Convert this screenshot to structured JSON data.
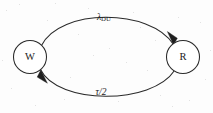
{
  "figure": {
    "background_color": "#fdfdfd",
    "line_color": "#2a2a2a",
    "text_color": "#1c1c1c"
  },
  "nodes": [
    {
      "id": "W",
      "label": "W",
      "shape": "circle",
      "cx": 30,
      "cy": 57,
      "r": 16.5
    },
    {
      "id": "R",
      "label": "R",
      "shape": "circle",
      "cx": 183,
      "cy": 57,
      "r": 16.5
    }
  ],
  "edges": [
    {
      "id": "w-to-r",
      "from": "W",
      "to": "R",
      "label_symbol": "λ",
      "label_subscript": "DU",
      "label_plain": "λDU",
      "position": "top",
      "arrow_at": "R",
      "label_x": 104,
      "label_y": 18
    },
    {
      "id": "r-to-w",
      "from": "R",
      "to": "W",
      "label_symbol": "τ/2",
      "label_subscript": "",
      "label_plain": "τ/2",
      "position": "bottom",
      "arrow_at": "W",
      "label_x": 101,
      "label_y": 93
    }
  ],
  "geometry": {
    "top_arc_path": "M 41.5 45.5 C 60 8 150 8 173.5 44.5",
    "bottom_arc_path": "M 174.5 70.5 C 152 105 58 105 40.5 69.5",
    "top_arrow_points": "173.5,45 167.4,31.6 177.3,38.2",
    "bottom_arrow_points": "40.8,70 47.4,83.2 37.2,77.1"
  }
}
